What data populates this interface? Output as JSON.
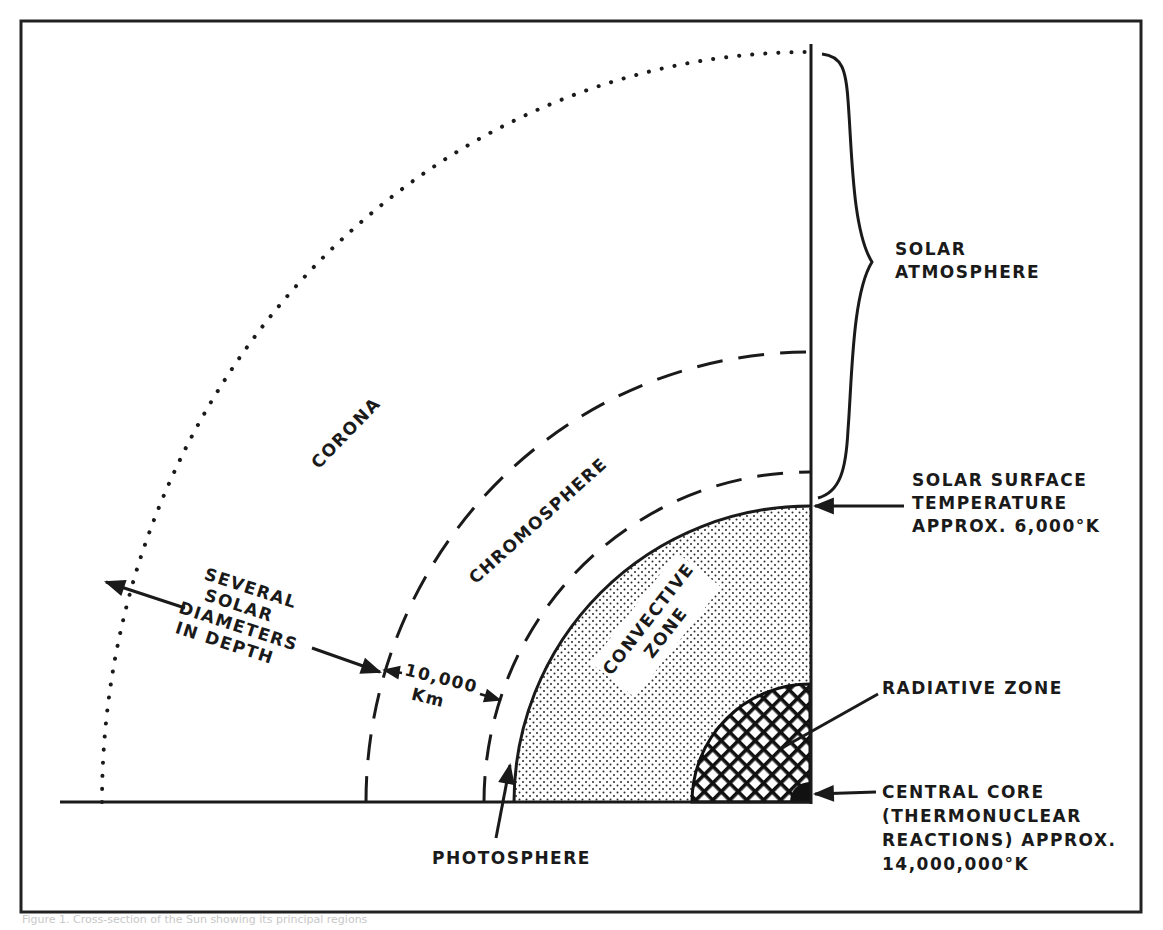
{
  "figure": {
    "caption": "Figure 1. Cross-section of the Sun showing its principal regions"
  },
  "colors": {
    "ink": "#1a1a1a",
    "frame": "#222222",
    "background": "#ffffff",
    "stipple": "#2a2a2a",
    "crosshatch": "#111111"
  },
  "regions": {
    "corona": "CORONA",
    "chromosphere": "CHROMOSPHERE",
    "convective_zone_line1": "CONVECTIVE",
    "convective_zone_line2": "ZONE"
  },
  "annotations": {
    "depth": {
      "line1": "SEVERAL",
      "line2": "SOLAR",
      "line3": "DIAMETERS",
      "line4": "IN DEPTH"
    },
    "thickness": {
      "value": "10,000",
      "unit": "Km"
    },
    "photosphere": "PHOTOSPHERE",
    "solar_atmosphere": {
      "line1": "SOLAR",
      "line2": "ATMOSPHERE"
    },
    "surface_temperature": {
      "line1": "SOLAR SURFACE",
      "line2": "TEMPERATURE",
      "line3": "APPROX. 6,000°K"
    },
    "radiative_zone": "RADIATIVE ZONE",
    "central_core": {
      "line1": "CENTRAL CORE",
      "line2": "(THERMONUCLEAR",
      "line3": "REACTIONS) APPROX.",
      "line4": "14,000,000°K"
    }
  }
}
